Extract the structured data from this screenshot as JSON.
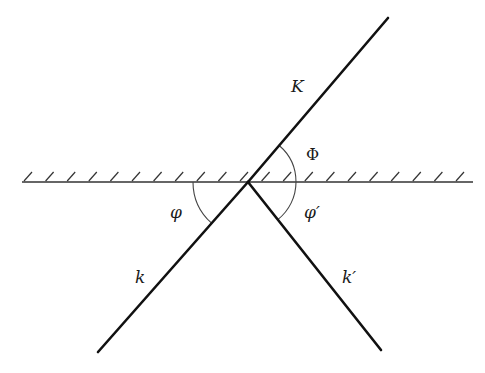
{
  "diagram": {
    "surface": {
      "label": "reflecting-surface",
      "hatched_side": "top"
    },
    "rays": [
      {
        "id": "K",
        "label": "K",
        "role": "transmitted/outgoing ray"
      },
      {
        "id": "k",
        "label": "k",
        "role": "incident ray"
      },
      {
        "id": "k_prime",
        "label": "k′",
        "role": "reflected ray"
      }
    ],
    "angles": [
      {
        "id": "Phi",
        "label": "Φ",
        "between": [
          "K",
          "surface"
        ]
      },
      {
        "id": "phi",
        "label": "φ",
        "between": [
          "k",
          "surface"
        ]
      },
      {
        "id": "phi_prime",
        "label": "φ′",
        "between": [
          "k_prime",
          "surface"
        ]
      }
    ]
  }
}
